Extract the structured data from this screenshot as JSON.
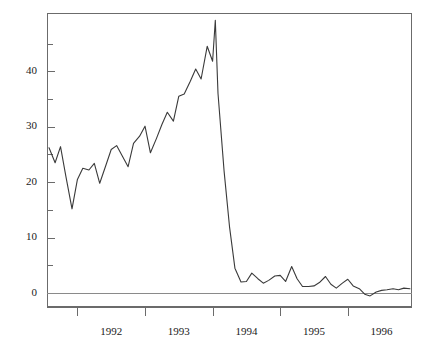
{
  "chart_data": {
    "type": "line",
    "title": "",
    "subtitle": "",
    "xlabel": "",
    "ylabel": "",
    "grid": false,
    "legend": null,
    "xlim": [
      1991.55,
      1996.95
    ],
    "ylim": [
      -2.5,
      50.5
    ],
    "yticks_major": [
      0,
      10,
      20,
      30,
      40
    ],
    "yticks_minor": [
      5,
      15,
      25,
      35,
      45
    ],
    "ytick_labels": [
      "0",
      "10",
      "20",
      "30",
      "40"
    ],
    "xtick_labels": [
      "1992",
      "1993",
      "1994",
      "1995",
      "1996"
    ],
    "xtick_label_positions": [
      1992.5,
      1993.5,
      1994.5,
      1995.5,
      1996.5
    ],
    "xticks_major": [
      1992.0,
      1993.0,
      1994.0,
      1995.0,
      1996.0,
      1997.0
    ],
    "zero_line": 0,
    "series": [
      {
        "name": "series-1",
        "color": "#3a3a3a",
        "x": [
          1991.58,
          1991.67,
          1991.75,
          1991.83,
          1991.92,
          1992.0,
          1992.08,
          1992.17,
          1992.25,
          1992.33,
          1992.42,
          1992.5,
          1992.58,
          1992.67,
          1992.75,
          1992.83,
          1992.92,
          1993.0,
          1993.08,
          1993.17,
          1993.25,
          1993.33,
          1993.42,
          1993.5,
          1993.58,
          1993.67,
          1993.75,
          1993.83,
          1993.92,
          1994.0,
          1994.04,
          1994.08,
          1994.17,
          1994.25,
          1994.33,
          1994.42,
          1994.5,
          1994.58,
          1994.67,
          1994.75,
          1994.83,
          1994.92,
          1995.0,
          1995.08,
          1995.17,
          1995.25,
          1995.33,
          1995.42,
          1995.5,
          1995.58,
          1995.67,
          1995.75,
          1995.83,
          1995.92,
          1996.0,
          1996.08,
          1996.17,
          1996.25,
          1996.33,
          1996.42,
          1996.5,
          1996.58,
          1996.67,
          1996.75,
          1996.83,
          1996.92
        ],
        "y": [
          26.2,
          23.5,
          26.4,
          21.0,
          15.2,
          20.5,
          22.5,
          22.2,
          23.4,
          19.8,
          23.0,
          25.9,
          26.6,
          24.6,
          22.8,
          27.0,
          28.3,
          30.1,
          25.3,
          27.9,
          30.4,
          32.6,
          31.0,
          35.5,
          35.9,
          38.2,
          40.4,
          38.6,
          44.5,
          41.8,
          49.2,
          36.0,
          22.0,
          12.0,
          4.5,
          2.0,
          2.1,
          3.6,
          2.6,
          1.8,
          2.3,
          3.1,
          3.2,
          2.1,
          4.8,
          2.6,
          1.2,
          1.2,
          1.3,
          1.9,
          3.0,
          1.6,
          0.9,
          1.8,
          2.5,
          1.3,
          0.8,
          -0.2,
          -0.5,
          0.2,
          0.5,
          0.6,
          0.8,
          0.6,
          0.9,
          0.8
        ]
      }
    ]
  },
  "axes": {
    "plot_left_px": 47,
    "plot_right_px": 412,
    "plot_top_px": 13,
    "plot_bottom_px": 307
  }
}
